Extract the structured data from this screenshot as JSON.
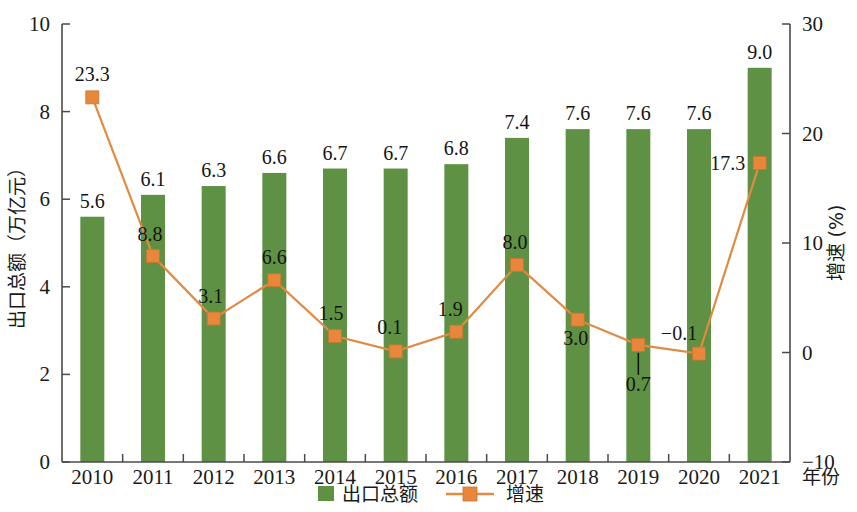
{
  "chart_data": {
    "type": "bar",
    "title": "",
    "categories": [
      "2010",
      "2011",
      "2012",
      "2013",
      "2014",
      "2015",
      "2016",
      "2017",
      "2018",
      "2019",
      "2020",
      "2021"
    ],
    "xlabel": "年份",
    "grid": false,
    "legend_position": "bottom",
    "series": [
      {
        "name": "出口总额",
        "type": "bar",
        "axis": "left",
        "unit": "万亿元",
        "color": "#5e9143",
        "values": [
          5.6,
          6.1,
          6.3,
          6.6,
          6.7,
          6.7,
          6.8,
          7.4,
          7.6,
          7.6,
          7.6,
          9.0
        ],
        "labels": [
          "5.6",
          "6.1",
          "6.3",
          "6.6",
          "6.7",
          "6.7",
          "6.8",
          "7.4",
          "7.6",
          "7.6",
          "7.6",
          "9.0"
        ]
      },
      {
        "name": "增速",
        "type": "line",
        "axis": "right",
        "unit": "%",
        "color": "#e08a42",
        "marker_color": "#e8863c",
        "values": [
          23.3,
          8.8,
          3.1,
          6.6,
          1.5,
          0.1,
          1.9,
          8.0,
          3.0,
          0.7,
          -0.1,
          17.3
        ],
        "labels": [
          "23.3",
          "8.8",
          "3.1",
          "6.6",
          "1.5",
          "0.1",
          "1.9",
          "8.0",
          "3.0",
          "0.7",
          "−0.1",
          "17.3"
        ]
      }
    ],
    "left_axis": {
      "title": "出口总额（万亿元）",
      "ticks": [
        "0",
        "2",
        "4",
        "6",
        "8",
        "10"
      ],
      "tick_values": [
        0,
        2,
        4,
        6,
        8,
        10
      ],
      "ylim": [
        0,
        10
      ]
    },
    "right_axis": {
      "title": "增速 (%)",
      "ticks": [
        "−10",
        "0",
        "10",
        "20",
        "30"
      ],
      "tick_values": [
        -10,
        0,
        10,
        20,
        30
      ],
      "ylim": [
        -10,
        30
      ]
    },
    "legend": [
      {
        "label": "出口总额",
        "marker": "square",
        "color": "#5e9143"
      },
      {
        "label": "增速",
        "marker": "line-square",
        "color": "#e08a42"
      }
    ]
  }
}
